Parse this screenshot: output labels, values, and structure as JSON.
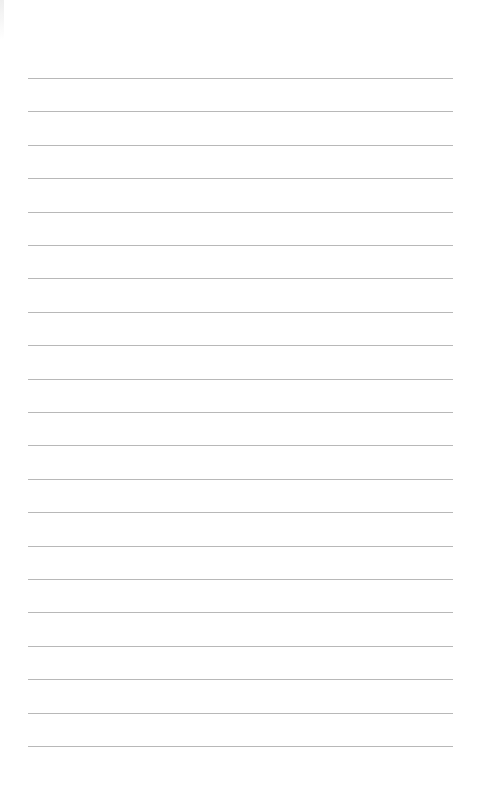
{
  "page": {
    "type": "lined-paper",
    "line_count": 21,
    "first_line_y": 78,
    "line_spacing": 33.4,
    "line_color": "#b8b8b8",
    "background": "#ffffff",
    "text": ""
  }
}
